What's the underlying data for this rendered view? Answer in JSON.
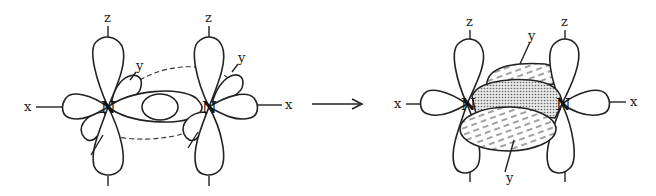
{
  "figure": {
    "left_panel": {
      "atoms": [
        "N",
        "N"
      ],
      "axis_labels": {
        "z_left": "z",
        "z_right": "z",
        "x_left": "x",
        "x_right": "x",
        "y_left": "y",
        "y_right": "y"
      }
    },
    "arrow": "→",
    "right_panel": {
      "atoms": [
        "N",
        "N"
      ],
      "axis_labels": {
        "z_left": "z",
        "z_right": "z",
        "x_left": "x",
        "x_right": "x",
        "y_top": "y",
        "y_bottom": "y"
      }
    },
    "colors": {
      "stroke": "#222222",
      "sigma_fill": "#b8b8b8",
      "pi_fill": "#e6e6e6",
      "background": "#ffffff"
    }
  }
}
